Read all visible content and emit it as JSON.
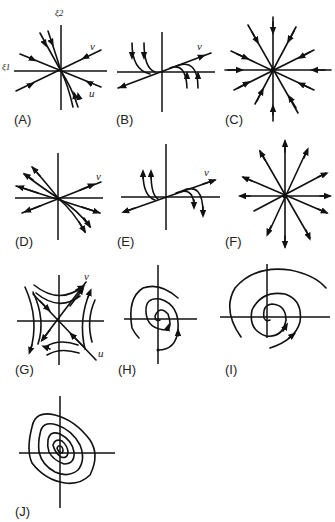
{
  "figure": {
    "axis_labels": {
      "x": "ξ1",
      "y": "ξ2"
    },
    "eigenvector_labels": {
      "v": "v",
      "u": "u"
    },
    "panels": [
      {
        "id": "A",
        "label": "(A)",
        "type": "stable node (distinct eigenvalues)"
      },
      {
        "id": "B",
        "label": "(B)",
        "type": "degenerate node with zero eigenvalue"
      },
      {
        "id": "C",
        "label": "(C)",
        "type": "stable star node"
      },
      {
        "id": "D",
        "label": "(D)",
        "type": "unstable node (distinct eigenvalues)"
      },
      {
        "id": "E",
        "label": "(E)",
        "type": "degenerate node with zero eigenvalue"
      },
      {
        "id": "F",
        "label": "(F)",
        "type": "unstable star node"
      },
      {
        "id": "G",
        "label": "(G)",
        "type": "saddle"
      },
      {
        "id": "H",
        "label": "(H)",
        "type": "stable spiral"
      },
      {
        "id": "I",
        "label": "(I)",
        "type": "unstable spiral"
      },
      {
        "id": "J",
        "label": "(J)",
        "type": "center"
      }
    ]
  }
}
